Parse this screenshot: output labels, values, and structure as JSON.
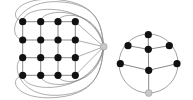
{
  "colors": {
    "background": "#ffffff",
    "node_fill": "#111111",
    "hub_fill": "#c8c8c8",
    "hub_stroke": "#9a9a9a",
    "edge": "#8a8a8a"
  },
  "left_graph": {
    "description": "4x4 grid graph with an apex (hub) vertex connected to all outer-face vertices",
    "grid_x": [
      22.7,
      40.7,
      58,
      75.3
    ],
    "grid_y": [
      21.7,
      40,
      57.7,
      75.3
    ],
    "node_radius": 3.6,
    "hub": {
      "x": 103.7,
      "y": 46.7,
      "r": 3.4
    }
  },
  "right_graph": {
    "description": "Wheel-like planar graph inside a circle with one gray apex at bottom",
    "outer_circle": {
      "cx": 148.5,
      "cy": 63.5,
      "r": 29.5
    },
    "nodes": [
      {
        "id": "top",
        "x": 148.3,
        "y": 34.7
      },
      {
        "id": "upper-left",
        "x": 128,
        "y": 45.7
      },
      {
        "id": "center",
        "x": 148.3,
        "y": 49.3
      },
      {
        "id": "upper-right",
        "x": 169.3,
        "y": 45.7
      },
      {
        "id": "left",
        "x": 120.3,
        "y": 63.7
      },
      {
        "id": "right",
        "x": 177,
        "y": 63.7
      },
      {
        "id": "lower-center",
        "x": 148.7,
        "y": 70.3
      }
    ],
    "hub": {
      "id": "bottom",
      "x": 148.7,
      "y": 93,
      "r": 3.4
    },
    "edges": [
      [
        "top",
        "center"
      ],
      [
        "upper-left",
        "center"
      ],
      [
        "center",
        "upper-right"
      ],
      [
        "center",
        "lower-center"
      ],
      [
        "left",
        "lower-center"
      ],
      [
        "lower-center",
        "right"
      ],
      [
        "lower-center",
        "bottom"
      ]
    ],
    "node_radius": 3.6
  }
}
